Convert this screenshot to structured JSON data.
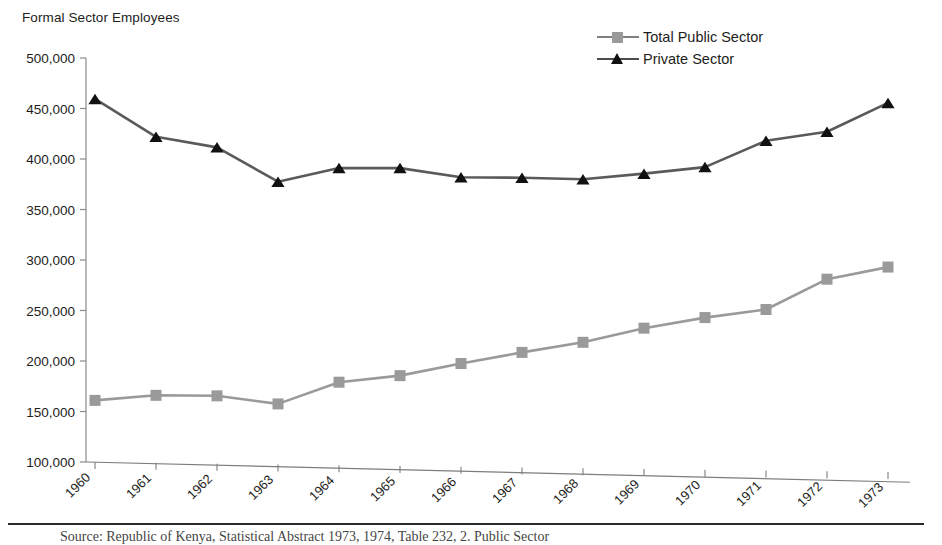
{
  "figure": {
    "title": "Formal Sector Employees",
    "source_caption": "Source: Republic of Kenya, Statistical Abstract 1973, 1974, Table 232, 2. Public Sector"
  },
  "legend": {
    "position": "top-right",
    "items": [
      {
        "label": "Total Public Sector",
        "marker": "square",
        "color": "#9a9a9a"
      },
      {
        "label": "Private Sector",
        "marker": "triangle",
        "color": "#111111"
      }
    ]
  },
  "axes": {
    "y_ticks": [
      "100,000",
      "150,000",
      "200,000",
      "250,000",
      "300,000",
      "350,000",
      "400,000",
      "450,000",
      "500,000"
    ],
    "x_ticks": [
      "1960",
      "1961",
      "1962",
      "1963",
      "1964",
      "1965",
      "1966",
      "1967",
      "1968",
      "1969",
      "1970",
      "1971",
      "1972",
      "1973"
    ]
  },
  "chart_data": {
    "type": "line",
    "title": "Formal Sector Employees",
    "xlabel": "",
    "ylabel": "",
    "ylim": [
      100000,
      500000
    ],
    "ytick_step": 50000,
    "grid": false,
    "legend_position": "top-right",
    "categories": [
      "1960",
      "1961",
      "1962",
      "1963",
      "1964",
      "1965",
      "1966",
      "1967",
      "1968",
      "1969",
      "1970",
      "1971",
      "1972",
      "1973"
    ],
    "series": [
      {
        "name": "Total Public Sector",
        "marker": "square",
        "color": "#9a9a9a",
        "values": [
          161000,
          166000,
          165500,
          157500,
          179000,
          185500,
          197500,
          208500,
          218500,
          232500,
          243000,
          251000,
          281000,
          293000
        ]
      },
      {
        "name": "Private Sector",
        "marker": "triangle",
        "color": "#111111",
        "values": [
          459500,
          422000,
          411500,
          377500,
          391000,
          391000,
          382000,
          381500,
          380000,
          385500,
          392000,
          418000,
          427000,
          455500
        ]
      }
    ]
  }
}
